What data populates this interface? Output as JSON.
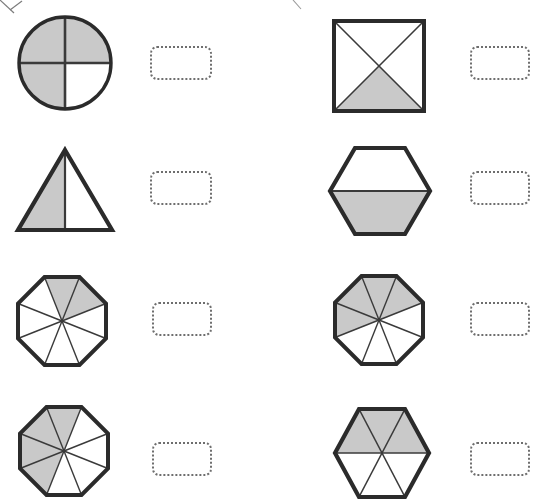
{
  "page": {
    "background_color": "#ffffff",
    "width": 537,
    "height": 504
  },
  "style": {
    "shape_outline_color": "#2b2b2b",
    "shape_divider_color": "#3a3a3a",
    "shaded_fill_color": "#c9c9c9",
    "unshaded_fill_color": "#ffffff",
    "answer_box_border_color": "#6e6e6e"
  },
  "answer_box": {
    "value": "",
    "placeholder": ""
  },
  "problems": [
    {
      "id": "problem-1",
      "shape": "circle",
      "shape_label": "circle-quarters",
      "total_parts": 4,
      "shaded_parts": 3,
      "fraction": "3/4",
      "shaded_positions": [
        "top-left",
        "top-right",
        "bottom-left"
      ],
      "answer": ""
    },
    {
      "id": "problem-2",
      "shape": "square",
      "shape_label": "square-diagonals",
      "total_parts": 4,
      "shaded_parts": 1,
      "fraction": "1/4",
      "shaded_positions": [
        "bottom"
      ],
      "answer": ""
    },
    {
      "id": "problem-3",
      "shape": "triangle",
      "shape_label": "triangle-halves",
      "total_parts": 2,
      "shaded_parts": 1,
      "fraction": "1/2",
      "shaded_positions": [
        "left"
      ],
      "answer": ""
    },
    {
      "id": "problem-4",
      "shape": "hexagon",
      "shape_label": "hexagon-halves",
      "total_parts": 2,
      "shaded_parts": 1,
      "fraction": "1/2",
      "shaded_positions": [
        "bottom"
      ],
      "answer": ""
    },
    {
      "id": "problem-5",
      "shape": "octagon",
      "shape_label": "octagon-eighths",
      "total_parts": 8,
      "shaded_parts": 2,
      "fraction": "2/8",
      "shaded_positions": [
        "wedge-1",
        "wedge-2"
      ],
      "answer": ""
    },
    {
      "id": "problem-6",
      "shape": "octagon",
      "shape_label": "octagon-eighths",
      "total_parts": 8,
      "shaded_parts": 4,
      "fraction": "4/8",
      "shaded_positions": [
        "wedge-0",
        "wedge-1",
        "wedge-2",
        "wedge-7"
      ],
      "answer": ""
    },
    {
      "id": "problem-7",
      "shape": "octagon",
      "shape_label": "octagon-eighths",
      "total_parts": 8,
      "shaded_parts": 4,
      "fraction": "4/8",
      "shaded_positions": [
        "wedge-0",
        "wedge-1",
        "wedge-6",
        "wedge-7"
      ],
      "answer": ""
    },
    {
      "id": "problem-8",
      "shape": "hexagon",
      "shape_label": "hexagon-sixths",
      "total_parts": 6,
      "shaded_parts": 3,
      "fraction": "3/6",
      "shaded_positions": [
        "wedge-0",
        "wedge-1",
        "wedge-2"
      ],
      "answer": ""
    }
  ]
}
